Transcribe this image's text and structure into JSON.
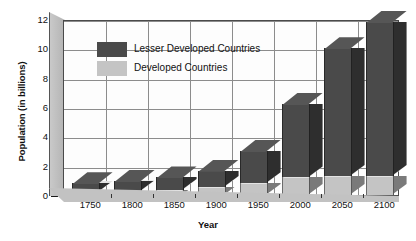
{
  "chart_data": {
    "type": "bar",
    "title": "",
    "subtype": "stacked-3d-column",
    "xlabel": "Year",
    "ylabel": "Population (in billions)",
    "categories": [
      "1750",
      "1800",
      "1850",
      "1900",
      "1950",
      "2000",
      "2050",
      "2100"
    ],
    "ylim": [
      0,
      12
    ],
    "yticks": [
      0,
      2,
      4,
      6,
      8,
      10,
      12
    ],
    "ytick_labels": [
      "0",
      "2",
      "4",
      "6",
      "8",
      "10",
      "12"
    ],
    "grid": true,
    "legend_position": "upper-left-inside",
    "series": [
      {
        "name": "Developed Countries",
        "color": "#c4c4c4",
        "values": [
          0.2,
          0.25,
          0.35,
          0.55,
          0.8,
          1.2,
          1.3,
          1.3
        ]
      },
      {
        "name": "Lesser Developed Countries",
        "color": "#4a4a4a",
        "values": [
          0.6,
          0.7,
          0.85,
          1.1,
          2.2,
          5.0,
          8.7,
          10.5
        ]
      }
    ],
    "totals": [
      0.8,
      0.95,
      1.2,
      1.65,
      3.0,
      6.2,
      10.0,
      11.8
    ]
  },
  "legend": {
    "items": [
      {
        "label": "Lesser Developed Countries",
        "color": "#4a4a4a"
      },
      {
        "label": "Developed Countries",
        "color": "#c4c4c4"
      }
    ]
  },
  "axes": {
    "y_title": "Population (in billions)",
    "x_title": "Year",
    "y_ticks": [
      "12",
      "10",
      "8",
      "6",
      "4",
      "2",
      "0"
    ],
    "x_ticks": [
      "1750",
      "1800",
      "1850",
      "1900",
      "1950",
      "2000",
      "2050",
      "2100"
    ]
  },
  "colors": {
    "lesser_developed": "#4a4a4a",
    "developed": "#c4c4c4",
    "grid": "#8c8c8c",
    "frame": "#4a4a4a",
    "wall": "#bdbdbd",
    "floor": "#c2c2c2",
    "text": "#111111"
  }
}
